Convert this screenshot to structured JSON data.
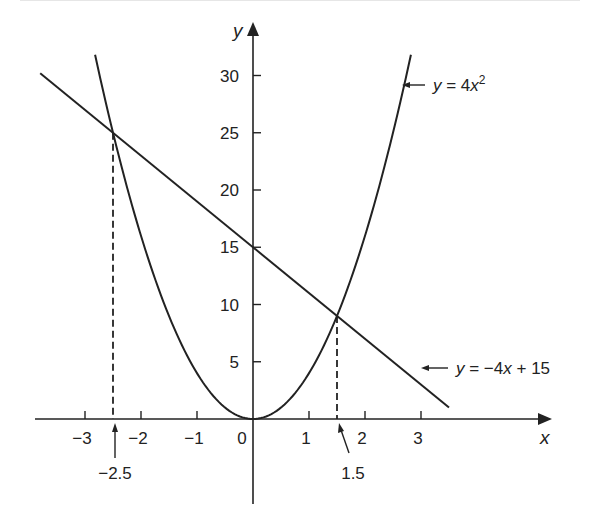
{
  "chart_data": {
    "type": "line",
    "title": "",
    "xlabel": "x",
    "ylabel": "y",
    "xlim": [
      -3.8,
      5.3
    ],
    "ylim": [
      -7.4,
      34.3
    ],
    "grid": false,
    "legend": "inline annotations with arrows",
    "x_ticks": [
      -3,
      -2,
      -1,
      0,
      1,
      2,
      3
    ],
    "x_tick_labels": [
      "−3",
      "−2",
      "−1",
      "0",
      "1",
      "2",
      "3"
    ],
    "y_ticks": [
      5,
      10,
      15,
      20,
      25,
      30
    ],
    "y_tick_labels": [
      "5",
      "10",
      "15",
      "20",
      "25",
      "30"
    ],
    "series": [
      {
        "name": "y = 4x²",
        "kind": "parabola",
        "equation": "y = 4x^2",
        "x_range": [
          -2.82,
          2.82
        ],
        "x": [
          -2.82,
          -2.5,
          -2,
          -1.5,
          -1,
          -0.5,
          0,
          0.5,
          1,
          1.5,
          2,
          2.5,
          2.82
        ],
        "values": [
          31.8,
          25,
          16,
          9,
          4,
          1,
          0,
          1,
          4,
          9,
          16,
          25,
          31.8
        ]
      },
      {
        "name": "y = −4x + 15",
        "kind": "line",
        "equation": "y = -4x + 15",
        "x_range": [
          -3.8,
          3.5
        ],
        "x": [
          -3.8,
          -2.5,
          0,
          1.5,
          3.5
        ],
        "values": [
          30.2,
          25,
          15,
          9,
          1
        ]
      }
    ],
    "intersections": [
      {
        "x": -2.5,
        "y": 25,
        "label": "−2.5"
      },
      {
        "x": 1.5,
        "y": 9,
        "label": "1.5"
      }
    ],
    "annotations": [
      {
        "text_parts": [
          "y",
          " = 4",
          "x",
          "2"
        ],
        "points_to": "parabola"
      },
      {
        "text_parts": [
          "y",
          " = −4",
          "x",
          " + 15"
        ],
        "points_to": "line"
      },
      {
        "text": "−2.5",
        "points_to": "x = -2.5"
      },
      {
        "text": "1.5",
        "points_to": "x = 1.5"
      }
    ]
  },
  "labels": {
    "x_axis": "x",
    "y_axis": "y",
    "origin": "0",
    "parabola_eq": {
      "y": "y",
      "eq": " = 4",
      "x": "x",
      "sup": "2"
    },
    "line_eq": {
      "y": "y",
      "eq": " = −4",
      "x": "x",
      "rest": " + 15"
    },
    "root_left": "−2.5",
    "root_right": "1.5"
  },
  "colors": {
    "ink": "#222222",
    "background": "#ffffff"
  }
}
